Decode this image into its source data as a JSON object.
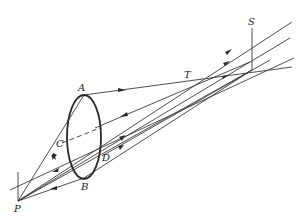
{
  "figure": {
    "type": "geometric-optics-diagram",
    "labels": {
      "P": "P",
      "A": "A",
      "B": "B",
      "C": "C",
      "D": "D",
      "T": "T",
      "S": "S"
    },
    "colors": {
      "line": "#3a3a3a",
      "ellipse": "#2a2a2a",
      "background": "#ffffff"
    }
  }
}
